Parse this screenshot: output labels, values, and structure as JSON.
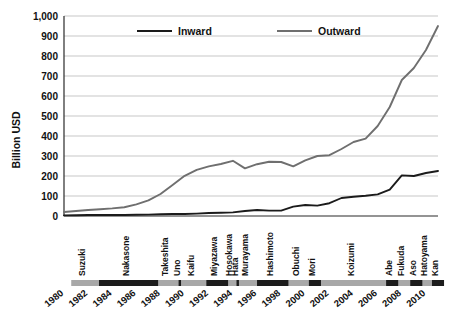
{
  "chart_data": {
    "type": "line",
    "title": "",
    "xlabel": "",
    "ylabel": "Billion USD",
    "ylim": [
      0,
      1000
    ],
    "xlim": [
      1980,
      2011
    ],
    "grid": true,
    "legend_position": "top-center",
    "y_ticks": [
      "0",
      "100",
      "200",
      "300",
      "400",
      "500",
      "600",
      "700",
      "800",
      "900",
      "1,000"
    ],
    "y_tick_values": [
      0,
      100,
      200,
      300,
      400,
      500,
      600,
      700,
      800,
      900,
      1000
    ],
    "x_ticks": [
      "1980",
      "1982",
      "1984",
      "1986",
      "1988",
      "1990",
      "1992",
      "1994",
      "1996",
      "1998",
      "2000",
      "2002",
      "2004",
      "2006",
      "2008",
      "2010"
    ],
    "x_tick_values": [
      1980,
      1982,
      1984,
      1986,
      1988,
      1990,
      1992,
      1994,
      1996,
      1998,
      2000,
      2002,
      2004,
      2006,
      2008,
      2010
    ],
    "x": [
      1980,
      1981,
      1982,
      1983,
      1984,
      1985,
      1986,
      1987,
      1988,
      1989,
      1990,
      1991,
      1992,
      1993,
      1994,
      1995,
      1996,
      1997,
      1998,
      1999,
      2000,
      2001,
      2002,
      2003,
      2004,
      2005,
      2006,
      2007,
      2008,
      2009,
      2010,
      2011
    ],
    "series": [
      {
        "name": "Inward",
        "color": "#1b1b1b",
        "values": [
          3,
          4,
          5,
          5,
          5,
          5,
          6,
          7,
          9,
          10,
          10,
          12,
          15,
          16,
          18,
          25,
          30,
          27,
          27,
          47,
          55,
          52,
          64,
          90,
          96,
          101,
          108,
          132,
          203,
          200,
          215,
          225
        ]
      },
      {
        "name": "Outward",
        "color": "#6f6f6f",
        "values": [
          20,
          25,
          30,
          34,
          38,
          44,
          58,
          78,
          110,
          155,
          201,
          231,
          248,
          260,
          276,
          238,
          259,
          271,
          270,
          248,
          278,
          300,
          304,
          335,
          370,
          387,
          450,
          545,
          680,
          740,
          830,
          950
        ]
      }
    ],
    "annotation_track": {
      "label": "Japanese Prime Ministers",
      "items": [
        {
          "name": "Suzuki",
          "start": 1980.6,
          "end": 1982.9,
          "shaded": false
        },
        {
          "name": "Nakasone",
          "start": 1982.9,
          "end": 1987.8,
          "shaded": true
        },
        {
          "name": "Takeshita",
          "start": 1987.8,
          "end": 1989.5,
          "shaded": false
        },
        {
          "name": "Uno",
          "start": 1989.5,
          "end": 1989.7,
          "shaded": true
        },
        {
          "name": "Kaifu",
          "start": 1989.7,
          "end": 1991.8,
          "shaded": false
        },
        {
          "name": "Miyazawa",
          "start": 1991.8,
          "end": 1993.6,
          "shaded": true
        },
        {
          "name": "Hosokawa",
          "start": 1993.6,
          "end": 1994.3,
          "shaded": false
        },
        {
          "name": "Hata",
          "start": 1994.3,
          "end": 1994.5,
          "shaded": true
        },
        {
          "name": "Murayama",
          "start": 1994.5,
          "end": 1996.0,
          "shaded": false
        },
        {
          "name": "Hashimoto",
          "start": 1996.0,
          "end": 1998.6,
          "shaded": true
        },
        {
          "name": "Obuchi",
          "start": 1998.6,
          "end": 2000.3,
          "shaded": false
        },
        {
          "name": "Mori",
          "start": 2000.3,
          "end": 2001.3,
          "shaded": true
        },
        {
          "name": "Koizumi",
          "start": 2001.3,
          "end": 2006.7,
          "shaded": false
        },
        {
          "name": "Abe",
          "start": 2006.7,
          "end": 2007.7,
          "shaded": true
        },
        {
          "name": "Fukuda",
          "start": 2007.7,
          "end": 2008.7,
          "shaded": false
        },
        {
          "name": "Aso",
          "start": 2008.7,
          "end": 2009.7,
          "shaded": true
        },
        {
          "name": "Hatoyama",
          "start": 2009.7,
          "end": 2010.5,
          "shaded": false
        },
        {
          "name": "Kan",
          "start": 2010.5,
          "end": 2011.5,
          "shaded": true
        }
      ]
    }
  },
  "legend": {
    "entries": [
      {
        "label": "Inward",
        "color": "#1b1b1b"
      },
      {
        "label": "Outward",
        "color": "#6f6f6f"
      }
    ]
  },
  "axis": {
    "y_title": "Billion USD"
  }
}
